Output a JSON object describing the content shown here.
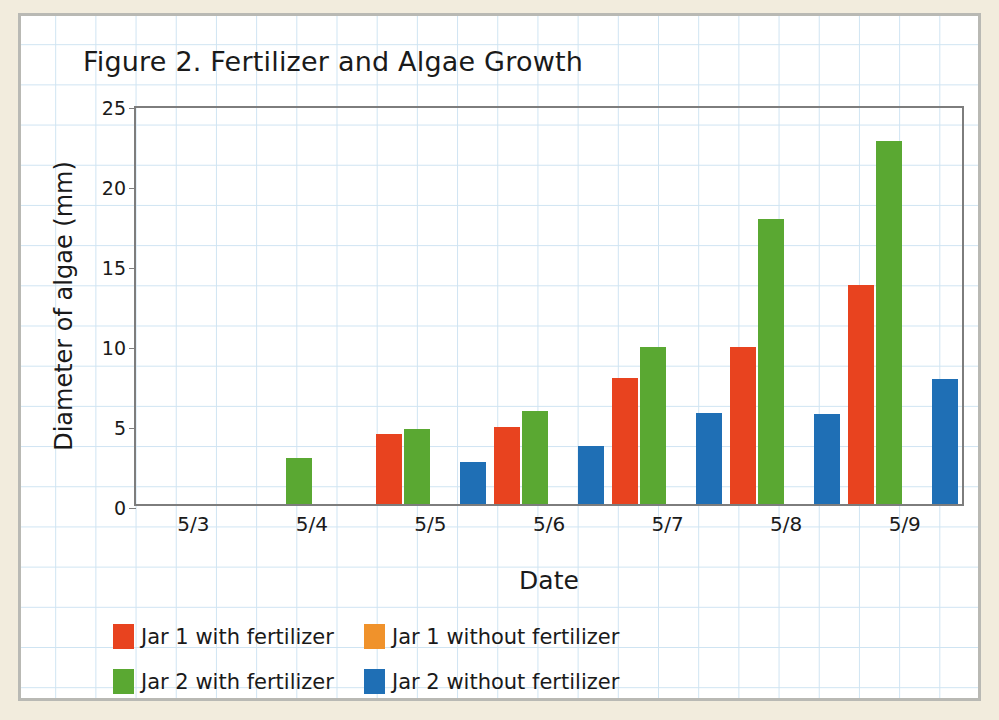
{
  "chart_data": {
    "type": "bar",
    "title": "Figure 2. Fertilizer and Algae Growth",
    "xlabel": "Date",
    "ylabel": "Diameter of algae (mm)",
    "categories": [
      "5/3",
      "5/4",
      "5/5",
      "5/6",
      "5/7",
      "5/8",
      "5/9"
    ],
    "ylim": [
      0,
      25
    ],
    "yticks": [
      0,
      5,
      10,
      15,
      20,
      25
    ],
    "grid": true,
    "legend_position": "bottom-left",
    "series": [
      {
        "name": "Jar 1 with fertilizer",
        "color": "#e8431f",
        "values": [
          0,
          0,
          4.4,
          4.8,
          7.9,
          9.8,
          13.7
        ]
      },
      {
        "name": "Jar 2 with fertilizer",
        "color": "#5aa832",
        "values": [
          0,
          2.9,
          4.7,
          5.8,
          9.8,
          17.8,
          22.7
        ]
      },
      {
        "name": "Jar 1 without fertilizer",
        "color": "#f0922b",
        "values": [
          0,
          0,
          0,
          0,
          0,
          0,
          0
        ]
      },
      {
        "name": "Jar 2 without fertilizer",
        "color": "#1f6fb5",
        "values": [
          0,
          0,
          2.6,
          3.6,
          5.7,
          5.6,
          7.8
        ]
      }
    ]
  },
  "legend": [
    {
      "label": "Jar 1 with fertilizer",
      "color": "#e8431f"
    },
    {
      "label": "Jar 1 without fertilizer",
      "color": "#f0922b"
    },
    {
      "label": "Jar 2 with fertilizer",
      "color": "#5aa832"
    },
    {
      "label": "Jar 2 without fertilizer",
      "color": "#1f6fb5"
    }
  ],
  "colors": {
    "page_background": "#f2ecdd",
    "paper": "#ffffff",
    "grid_line": "#cfe4f2",
    "axis_line": "#7d7d7d",
    "frame_border": "#b9b9b4"
  }
}
